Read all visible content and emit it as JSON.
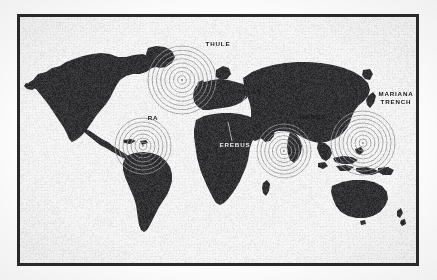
{
  "frame": {
    "border_color": "#2b2b2e",
    "background_color": "#ffffff",
    "page_background": "#fdfdfd"
  },
  "map": {
    "land_color": "#333336",
    "ocean_color": "#ffffff",
    "ripple_color": "#9a9a9e",
    "projection": "world-equirectangular-silhouette"
  },
  "labels": [
    {
      "id": "thule",
      "text": "THULE",
      "tone": "dark",
      "x": 218,
      "y": 44,
      "align": "center"
    },
    {
      "id": "atlas",
      "text": "ATLAS",
      "tone": "dark",
      "x": 250,
      "y": 92,
      "align": "center"
    },
    {
      "id": "ra",
      "text": "RA",
      "tone": "dark",
      "x": 153,
      "y": 118,
      "align": "center"
    },
    {
      "id": "hades",
      "text": "HADES",
      "tone": "dark",
      "x": 313,
      "y": 117,
      "align": "center"
    },
    {
      "id": "mariana",
      "text": "MARIANA\nTRENCH",
      "tone": "dark",
      "x": 396,
      "y": 97,
      "align": "center"
    },
    {
      "id": "erebus",
      "text": "EREBUS",
      "tone": "light",
      "x": 235,
      "y": 145,
      "align": "center"
    }
  ],
  "sites": [
    {
      "id": "thule",
      "name": "THULE",
      "x": 182,
      "y": 80,
      "rings": 8,
      "max_radius": 34,
      "has_ripple": true
    },
    {
      "id": "ra",
      "name": "RA",
      "x": 143,
      "y": 146,
      "rings": 7,
      "max_radius": 28,
      "has_ripple": true
    },
    {
      "id": "hades",
      "name": "HADES",
      "x": 284,
      "y": 151,
      "rings": 7,
      "max_radius": 27,
      "has_ripple": true
    },
    {
      "id": "mariana",
      "name": "MARIANA TRENCH",
      "x": 363,
      "y": 143,
      "rings": 8,
      "max_radius": 32,
      "has_ripple": true
    },
    {
      "id": "atlas",
      "name": "ATLAS",
      "x": 238,
      "y": 110,
      "rings": 0,
      "max_radius": 0,
      "has_ripple": false
    },
    {
      "id": "erebus",
      "name": "EREBUS",
      "x": 228,
      "y": 122,
      "rings": 0,
      "max_radius": 0,
      "has_ripple": false
    }
  ],
  "leader_lines": [
    {
      "id": "atlas-leader",
      "from_label": "atlas",
      "x1": 246,
      "y1": 96,
      "x2": 238,
      "y2": 110
    },
    {
      "id": "erebus-leader",
      "from_label": "erebus",
      "x1": 232,
      "y1": 141,
      "x2": 228,
      "y2": 122
    }
  ]
}
